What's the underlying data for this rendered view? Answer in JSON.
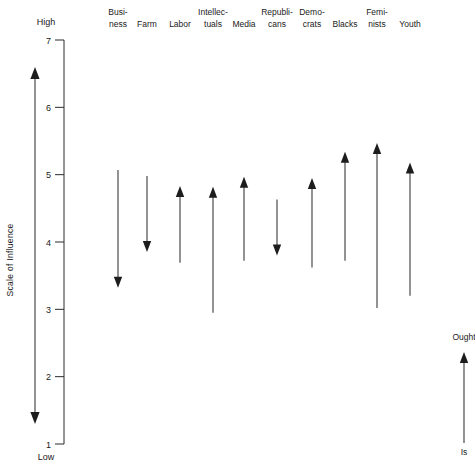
{
  "chart_data": {
    "type": "bar",
    "title": "",
    "subtitle": "",
    "xlabel": "",
    "ylabel": "Scale of Influence",
    "ylim": [
      1,
      7
    ],
    "ytick_labels": [
      "7",
      "6",
      "5",
      "4",
      "3",
      "2",
      "1"
    ],
    "ytick_values": [
      7,
      6,
      5,
      4,
      3,
      2,
      1
    ],
    "axis_top_label": "High",
    "axis_bottom_label": "Low",
    "grid": false,
    "legend_position": "bottom-right",
    "legend": {
      "top_label": "Ought",
      "bottom_label": "Is",
      "note": "arrow points from Is (current influence) to Ought (desired influence)"
    },
    "categories": [
      "Business",
      "Farm",
      "Labor",
      "Intellectuals",
      "Media",
      "Republicans",
      "Democrats",
      "Blacks",
      "Feminists",
      "Youth"
    ],
    "category_label_lines": [
      [
        "Busi-",
        "ness"
      ],
      [
        "",
        "Farm"
      ],
      [
        "",
        "Labor"
      ],
      [
        "Intellec-",
        "tuals"
      ],
      [
        "",
        "Media"
      ],
      [
        "Republi-",
        "cans"
      ],
      [
        "Demo-",
        "crats"
      ],
      [
        "",
        "Blacks"
      ],
      [
        "Femi-",
        "nists"
      ],
      [
        "",
        "Youth"
      ]
    ],
    "series": [
      {
        "name": "Is",
        "values": [
          5.07,
          4.98,
          3.69,
          2.95,
          3.72,
          4.63,
          3.62,
          3.72,
          3.02,
          3.2
        ]
      },
      {
        "name": "Ought",
        "values": [
          3.32,
          3.85,
          4.83,
          4.82,
          4.97,
          3.8,
          4.95,
          5.34,
          5.47,
          5.18
        ]
      }
    ],
    "directions": [
      "down",
      "down",
      "up",
      "up",
      "up",
      "down",
      "up",
      "up",
      "up",
      "up"
    ]
  },
  "axis": {
    "range_arrow_name": "scale-of-influence-range-arrow"
  }
}
